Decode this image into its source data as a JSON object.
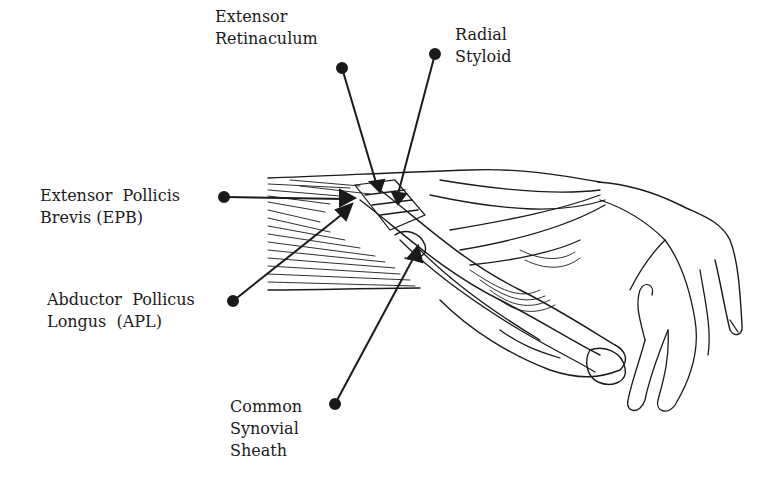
{
  "diagram": {
    "labels": [
      {
        "id": "extensor-retinaculum",
        "lines": [
          "Extensor",
          "Retinaculum"
        ]
      },
      {
        "id": "radial-styloid",
        "lines": [
          "Radial",
          "Styloid"
        ]
      },
      {
        "id": "epb",
        "lines": [
          "Extensor  Pollicis",
          "Brevis (EPB)"
        ]
      },
      {
        "id": "apl",
        "lines": [
          "Abductor  Pollicus",
          "Longus  (APL)"
        ]
      },
      {
        "id": "common-synovial-sheath",
        "lines": [
          "Common",
          "Synovial",
          "Sheath"
        ]
      }
    ],
    "colors": {
      "ink": "#1a1a1a",
      "background": "#ffffff"
    }
  }
}
